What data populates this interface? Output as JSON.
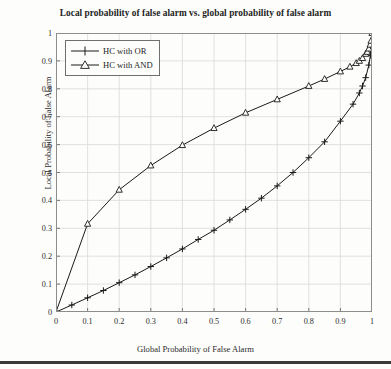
{
  "chart_data": {
    "type": "line",
    "title": "Local probability of false alarm vs. global probability of false alarm",
    "xlabel": "Global Probability of False Alarm",
    "ylabel": "Local Probability of False Alarm",
    "xlim": [
      0,
      1
    ],
    "ylim": [
      0,
      1
    ],
    "grid": true,
    "legend_position": "top-left",
    "xticks": [
      "0",
      "0.1",
      "0.2",
      "0.3",
      "0.4",
      "0.5",
      "0.6",
      "0.7",
      "0.8",
      "0.9",
      "1"
    ],
    "xtick_values": [
      0,
      0.1,
      0.2,
      0.3,
      0.4,
      0.5,
      0.6,
      0.7,
      0.8,
      0.9,
      1
    ],
    "yticks": [
      "0",
      "0.1",
      "0.2",
      "0.3",
      "0.4",
      "0.5",
      "0.6",
      "0.7",
      "0.8",
      "0.9",
      "1"
    ],
    "ytick_values": [
      0,
      0.1,
      0.2,
      0.3,
      0.4,
      0.5,
      0.6,
      0.7,
      0.8,
      0.9,
      1
    ],
    "series": [
      {
        "name": "HC with OR",
        "marker": "plus",
        "color": "#1a1a1a",
        "x": [
          0,
          0.05,
          0.1,
          0.15,
          0.2,
          0.25,
          0.3,
          0.35,
          0.4,
          0.45,
          0.5,
          0.55,
          0.6,
          0.65,
          0.7,
          0.75,
          0.8,
          0.85,
          0.9,
          0.94,
          0.96,
          0.97,
          0.98,
          0.99,
          0.995,
          1
        ],
        "values": [
          0,
          0.025,
          0.051,
          0.077,
          0.105,
          0.133,
          0.163,
          0.194,
          0.226,
          0.26,
          0.293,
          0.33,
          0.368,
          0.408,
          0.452,
          0.5,
          0.553,
          0.61,
          0.684,
          0.745,
          0.785,
          0.81,
          0.84,
          0.885,
          0.92,
          1
        ]
      },
      {
        "name": "HC with AND",
        "marker": "triangle",
        "color": "#1a1a1a",
        "x": [
          0,
          0.1,
          0.2,
          0.3,
          0.4,
          0.5,
          0.6,
          0.7,
          0.8,
          0.85,
          0.9,
          0.93,
          0.95,
          0.96,
          0.97,
          0.98,
          0.985,
          0.99,
          0.994,
          0.997,
          1
        ],
        "values": [
          0,
          0.316,
          0.438,
          0.525,
          0.598,
          0.659,
          0.714,
          0.762,
          0.81,
          0.835,
          0.862,
          0.879,
          0.892,
          0.9,
          0.91,
          0.925,
          0.932,
          0.944,
          0.958,
          0.972,
          1
        ]
      }
    ]
  },
  "legend": {
    "items": [
      {
        "label": "HC with OR"
      },
      {
        "label": "HC with AND"
      }
    ]
  }
}
